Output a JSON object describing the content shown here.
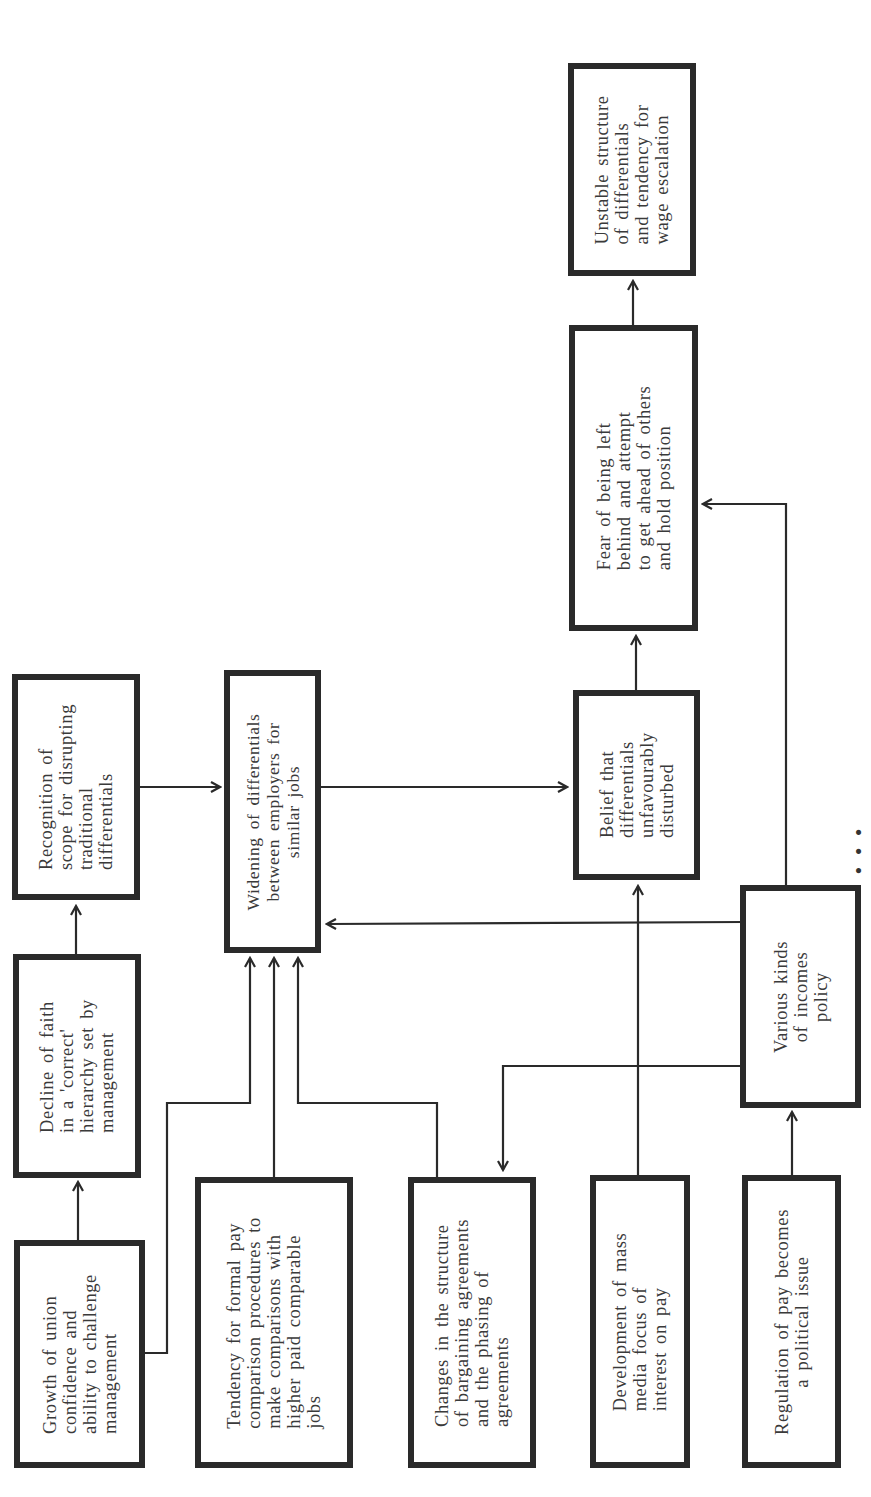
{
  "diagram": {
    "orientation": "rotated 90deg counterclockwise",
    "nodes": {
      "union_confidence": {
        "label": "Growth of union\nconfidence and\nability to challenge\nmanagement"
      },
      "decline_faith": {
        "label": "Decline of faith\nin a 'correct'\nhierarchy set by\nmanagement"
      },
      "recognition_scope": {
        "label": "Recognition of\nscope for disrupting\ntraditional\ndifferentials"
      },
      "widening": {
        "label": "Widening of differentials\nbetween employers for\nsimilar jobs"
      },
      "formal_pay": {
        "label": "Tendency for formal pay\ncomparison procedures to\nmake comparisons with\nhigher paid comparable\njobs"
      },
      "bargaining_changes": {
        "label": "Changes in the structure\nof bargaining agreements\nand the phasing of\nagreements"
      },
      "mass_media": {
        "label": "Development of mass\nmedia focus of\ninterest on pay"
      },
      "regulation_political": {
        "label": "Regulation of pay becomes\na political issue"
      },
      "incomes_policy": {
        "label": "Various kinds\nof incomes\npolicy"
      },
      "belief_disturbed": {
        "label": "Belief that\ndifferentials\nunfavourably\ndisturbed"
      },
      "fear_left_behind": {
        "label": "Fear of being left\nbehind and attempt\nto get ahead of others\nand hold position"
      },
      "unstable_structure": {
        "label": "Unstable structure\nof differentials\nand tendency for\nwage escalation"
      }
    },
    "edges": [
      {
        "from": "union_confidence",
        "to": "decline_faith"
      },
      {
        "from": "decline_faith",
        "to": "recognition_scope"
      },
      {
        "from": "recognition_scope",
        "to": "widening"
      },
      {
        "from": "union_confidence",
        "to": "widening"
      },
      {
        "from": "formal_pay",
        "to": "widening"
      },
      {
        "from": "bargaining_changes",
        "to": "widening"
      },
      {
        "from": "incomes_policy",
        "to": "widening"
      },
      {
        "from": "incomes_policy",
        "to": "bargaining_changes"
      },
      {
        "from": "incomes_policy",
        "to": "fear_left_behind"
      },
      {
        "from": "regulation_political",
        "to": "incomes_policy"
      },
      {
        "from": "mass_media",
        "to": "belief_disturbed"
      },
      {
        "from": "widening",
        "to": "belief_disturbed"
      },
      {
        "from": "belief_disturbed",
        "to": "fear_left_behind"
      },
      {
        "from": "fear_left_behind",
        "to": "unstable_structure"
      }
    ],
    "caption_clipped": "(caption text cut off at right edge)",
    "colors": {
      "stroke": "#2a2a2a",
      "text": "#3a3a3a",
      "background": "#ffffff"
    }
  }
}
